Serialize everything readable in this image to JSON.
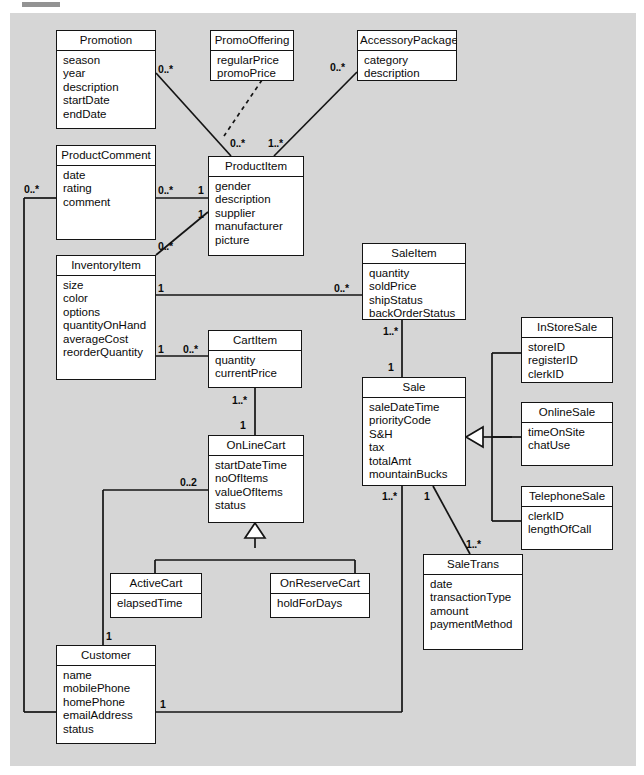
{
  "diagram": {
    "background_color": "#d6d6d6",
    "line_color": "#141414",
    "box_fill": "#ffffff"
  },
  "classes": [
    {
      "id": "promotion",
      "name": "Promotion",
      "attributes": [
        "season",
        "year",
        "description",
        "startDate",
        "endDate"
      ]
    },
    {
      "id": "promooffering",
      "name": "PromoOffering",
      "attributes": [
        "regularPrice",
        "promoPrice"
      ]
    },
    {
      "id": "accessorypackage",
      "name": "AccessoryPackage",
      "attributes": [
        "category",
        "description"
      ]
    },
    {
      "id": "productcomment",
      "name": "ProductComment",
      "attributes": [
        "date",
        "rating",
        "comment"
      ]
    },
    {
      "id": "productitem",
      "name": "ProductItem",
      "attributes": [
        "gender",
        "description",
        "supplier",
        "manufacturer",
        "picture"
      ]
    },
    {
      "id": "inventoryitem",
      "name": "InventoryItem",
      "attributes": [
        "size",
        "color",
        "options",
        "quantityOnHand",
        "averageCost",
        "reorderQuantity"
      ]
    },
    {
      "id": "saleitem",
      "name": "SaleItem",
      "attributes": [
        "quantity",
        "soldPrice",
        "shipStatus",
        "backOrderStatus"
      ]
    },
    {
      "id": "cartitem",
      "name": "CartItem",
      "attributes": [
        "quantity",
        "currentPrice"
      ]
    },
    {
      "id": "sale",
      "name": "Sale",
      "attributes": [
        "saleDateTime",
        "priorityCode",
        "S&H",
        "tax",
        "totalAmt",
        "mountainBucks"
      ]
    },
    {
      "id": "instoresale",
      "name": "InStoreSale",
      "attributes": [
        "storeID",
        "registerID",
        "clerkID"
      ]
    },
    {
      "id": "onlinesale",
      "name": "OnlineSale",
      "attributes": [
        "timeOnSite",
        "chatUse"
      ]
    },
    {
      "id": "telephonesale",
      "name": "TelephoneSale",
      "attributes": [
        "clerkID",
        "lengthOfCall"
      ]
    },
    {
      "id": "onlinecart",
      "name": "OnLineCart",
      "attributes": [
        "startDateTime",
        "noOfItems",
        "valueOfItems",
        "status"
      ]
    },
    {
      "id": "activecart",
      "name": "ActiveCart",
      "attributes": [
        "elapsedTime"
      ]
    },
    {
      "id": "onreservecart",
      "name": "OnReserveCart",
      "attributes": [
        "holdForDays"
      ]
    },
    {
      "id": "saletrans",
      "name": "SaleTrans",
      "attributes": [
        "date",
        "transactionType",
        "amount",
        "paymentMethod"
      ]
    },
    {
      "id": "customer",
      "name": "Customer",
      "attributes": [
        "name",
        "mobilePhone",
        "homePhone",
        "emailAddress",
        "status"
      ]
    }
  ],
  "multiplicities": [
    {
      "id": "m-promotion-productitem",
      "label": "0..*"
    },
    {
      "id": "m-productitem-promotion",
      "label": "0..*"
    },
    {
      "id": "m-accessorypackage",
      "label": "0..*"
    },
    {
      "id": "m-productitem-accessory",
      "label": "1..*"
    },
    {
      "id": "m-productcomment-left",
      "label": "0..*"
    },
    {
      "id": "m-productcomment-right",
      "label": "0..*"
    },
    {
      "id": "m-productitem-comment",
      "label": "1"
    },
    {
      "id": "m-productitem-inventory",
      "label": "1"
    },
    {
      "id": "m-inventory-productitem",
      "label": "0..*"
    },
    {
      "id": "m-inventory-saleitem",
      "label": "1"
    },
    {
      "id": "m-saleitem-inventory",
      "label": "0..*"
    },
    {
      "id": "m-inventory-cartitem",
      "label": "1"
    },
    {
      "id": "m-cartitem-inventory",
      "label": "0..*"
    },
    {
      "id": "m-saleitem-sale",
      "label": "1..*"
    },
    {
      "id": "m-sale-saleitem",
      "label": "1"
    },
    {
      "id": "m-cartitem-cart",
      "label": "1..*"
    },
    {
      "id": "m-cart-cartitem",
      "label": "1"
    },
    {
      "id": "m-cart-customer",
      "label": "0..2"
    },
    {
      "id": "m-customer-cart",
      "label": "1"
    },
    {
      "id": "m-sale-customer",
      "label": "1..*"
    },
    {
      "id": "m-customer-sale",
      "label": "1"
    },
    {
      "id": "m-sale-saletrans",
      "label": "1"
    },
    {
      "id": "m-saletrans-sale",
      "label": "1..*"
    }
  ]
}
